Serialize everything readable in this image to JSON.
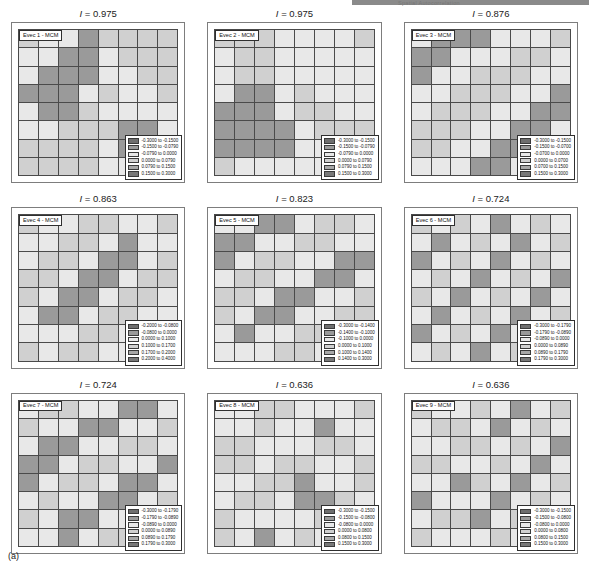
{
  "figure": {
    "label": "(a)",
    "header_note": "Spatial Autocorrelation",
    "title_prefix": "I = ",
    "palette": [
      "#6e6e6e",
      "#9a9a9a",
      "#e8e8e8",
      "#d0d0d0",
      "#a8a8a8",
      "#787878"
    ]
  },
  "chart_data": {
    "type": "heatmap",
    "xlabel": "",
    "ylabel": "",
    "grid_rows": 8,
    "grid_cols": 8,
    "legend_position": "inside-bottom-right",
    "panels": [
      {
        "panel_index": 1,
        "tag": "Evec 1 - MCM",
        "moran_i": "0.975",
        "title": "I = 0.975",
        "legend": [
          "-0.3000 to -0.1500",
          "-0.1500 to -0.0790",
          "-0.0790 to 0.0000",
          "0.0000 to 0.0790",
          "0.0790 to 0.1500",
          "0.1500 to 0.3000"
        ],
        "classes": [
          [
            3,
            2,
            2,
            1,
            3,
            3,
            3,
            3
          ],
          [
            2,
            2,
            1,
            1,
            2,
            3,
            3,
            3
          ],
          [
            2,
            1,
            1,
            1,
            2,
            2,
            3,
            3
          ],
          [
            1,
            1,
            1,
            2,
            3,
            2,
            2,
            3
          ],
          [
            2,
            1,
            1,
            3,
            2,
            2,
            2,
            2
          ],
          [
            2,
            2,
            3,
            3,
            3,
            1,
            1,
            2
          ],
          [
            3,
            3,
            3,
            3,
            2,
            1,
            1,
            2
          ],
          [
            3,
            3,
            3,
            3,
            2,
            2,
            2,
            3
          ]
        ]
      },
      {
        "panel_index": 2,
        "tag": "Evec 2 - MCM",
        "moran_i": "0.975",
        "title": "I = 0.975",
        "legend": [
          "-0.3000 to -0.1500",
          "-0.1500 to -0.0790",
          "-0.0790 to 0.0000",
          "0.0000 to 0.0790",
          "0.0790 to 0.1500",
          "0.1500 to 0.3000"
        ],
        "classes": [
          [
            3,
            3,
            3,
            2,
            2,
            2,
            2,
            3
          ],
          [
            2,
            3,
            3,
            2,
            2,
            2,
            2,
            2
          ],
          [
            2,
            3,
            3,
            2,
            2,
            2,
            2,
            2
          ],
          [
            2,
            1,
            1,
            2,
            3,
            2,
            2,
            2
          ],
          [
            1,
            1,
            1,
            2,
            3,
            3,
            2,
            2
          ],
          [
            1,
            1,
            1,
            1,
            2,
            3,
            3,
            3
          ],
          [
            1,
            1,
            1,
            1,
            2,
            2,
            3,
            3
          ],
          [
            3,
            2,
            2,
            2,
            2,
            2,
            3,
            3
          ]
        ]
      },
      {
        "panel_index": 3,
        "tag": "Evec 3 - MCM",
        "moran_i": "0.876",
        "title": "I = 0.876",
        "legend": [
          "-0.3000 to -0.1500",
          "-0.1500 to -0.0700",
          "-0.0700 to 0.0000",
          "0.0000 to 0.0700",
          "0.0700 to 0.1500",
          "0.1500 to 0.3000"
        ],
        "classes": [
          [
            2,
            1,
            1,
            1,
            2,
            2,
            2,
            3
          ],
          [
            1,
            1,
            2,
            2,
            2,
            3,
            3,
            2
          ],
          [
            1,
            2,
            2,
            3,
            3,
            3,
            2,
            2
          ],
          [
            2,
            2,
            3,
            3,
            3,
            2,
            2,
            1
          ],
          [
            2,
            3,
            3,
            3,
            2,
            2,
            1,
            1
          ],
          [
            3,
            3,
            3,
            2,
            2,
            1,
            1,
            2
          ],
          [
            3,
            3,
            2,
            2,
            1,
            1,
            2,
            2
          ],
          [
            2,
            2,
            2,
            1,
            1,
            2,
            2,
            3
          ]
        ]
      },
      {
        "panel_index": 4,
        "tag": "Evec 4 - MCM",
        "moran_i": "0.863",
        "title": "I = 0.863",
        "legend": [
          "-0.2000 to -0.0800",
          "-0.0800 to 0.0000",
          "0.0000 to 0.1000",
          "0.1000 to 0.1700",
          "0.1700 to 0.2000",
          "0.2000 to 0.4000"
        ],
        "classes": [
          [
            3,
            2,
            2,
            3,
            3,
            2,
            2,
            3
          ],
          [
            2,
            2,
            3,
            3,
            2,
            1,
            2,
            2
          ],
          [
            2,
            3,
            3,
            2,
            1,
            1,
            2,
            3
          ],
          [
            3,
            3,
            2,
            1,
            1,
            2,
            3,
            3
          ],
          [
            3,
            2,
            1,
            1,
            2,
            3,
            3,
            2
          ],
          [
            2,
            1,
            1,
            2,
            3,
            3,
            2,
            2
          ],
          [
            2,
            2,
            2,
            3,
            3,
            2,
            2,
            3
          ],
          [
            3,
            2,
            3,
            3,
            2,
            2,
            3,
            3
          ]
        ]
      },
      {
        "panel_index": 5,
        "tag": "Evec 5 - MCM",
        "moran_i": "0.823",
        "title": "I = 0.823",
        "legend": [
          "-0.3000 to -0.1400",
          "-0.1400 to -0.1000",
          "-0.1000 to 0.0000",
          "0.0000 to 0.1000",
          "0.1000 to 0.1400",
          "0.1400 to 0.3000"
        ],
        "classes": [
          [
            2,
            2,
            1,
            1,
            2,
            3,
            3,
            2
          ],
          [
            1,
            1,
            2,
            2,
            3,
            3,
            2,
            2
          ],
          [
            1,
            2,
            3,
            3,
            2,
            2,
            1,
            1
          ],
          [
            2,
            3,
            3,
            2,
            2,
            1,
            1,
            2
          ],
          [
            3,
            3,
            2,
            1,
            1,
            2,
            2,
            3
          ],
          [
            3,
            2,
            1,
            1,
            2,
            2,
            3,
            3
          ],
          [
            2,
            1,
            2,
            2,
            3,
            3,
            2,
            2
          ],
          [
            2,
            2,
            2,
            3,
            3,
            2,
            1,
            1
          ]
        ]
      },
      {
        "panel_index": 6,
        "tag": "Evec 6 - MCM",
        "moran_i": "0.724",
        "title": "I = 0.724",
        "legend": [
          "-0.3000 to -0.1790",
          "-0.1790 to -0.0890",
          "-0.0890 to 0.0000",
          "0.0000 to 0.0890",
          "0.0890 to 0.1790",
          "0.1790 to 0.3000"
        ],
        "classes": [
          [
            3,
            2,
            3,
            2,
            1,
            2,
            3,
            2
          ],
          [
            2,
            1,
            2,
            3,
            2,
            1,
            2,
            3
          ],
          [
            1,
            2,
            3,
            2,
            1,
            2,
            3,
            2
          ],
          [
            2,
            3,
            2,
            1,
            2,
            3,
            2,
            1
          ],
          [
            3,
            2,
            1,
            2,
            3,
            2,
            1,
            2
          ],
          [
            2,
            1,
            2,
            3,
            2,
            1,
            2,
            3
          ],
          [
            1,
            2,
            3,
            2,
            1,
            2,
            3,
            2
          ],
          [
            2,
            3,
            2,
            1,
            2,
            3,
            2,
            1
          ]
        ]
      },
      {
        "panel_index": 7,
        "tag": "Evec 7 - MCM",
        "moran_i": "0.724",
        "title": "I = 0.724",
        "legend": [
          "-0.3000 to -0.1790",
          "-0.1790 to -0.0890",
          "-0.0890 to 0.0000",
          "0.0000 to 0.0890",
          "0.0890 to 0.1790",
          "0.1790 to 0.3000"
        ],
        "classes": [
          [
            2,
            3,
            3,
            2,
            2,
            1,
            1,
            2
          ],
          [
            3,
            2,
            2,
            1,
            1,
            2,
            2,
            3
          ],
          [
            2,
            1,
            1,
            2,
            2,
            3,
            3,
            2
          ],
          [
            1,
            1,
            2,
            3,
            3,
            2,
            2,
            1
          ],
          [
            1,
            2,
            3,
            3,
            2,
            1,
            1,
            2
          ],
          [
            2,
            3,
            2,
            2,
            1,
            1,
            2,
            3
          ],
          [
            3,
            2,
            1,
            1,
            2,
            2,
            3,
            3
          ],
          [
            2,
            2,
            1,
            2,
            3,
            3,
            2,
            2
          ]
        ]
      },
      {
        "panel_index": 8,
        "tag": "Evec 8 - MCM",
        "moran_i": "0.636",
        "title": "I = 0.636",
        "legend": [
          "-0.3000 to -0.1500",
          "-0.1500 to -0.0800",
          "-0.0800 to 0.0000",
          "0.0000 to 0.0800",
          "0.0800 to 0.1500",
          "0.1500 to 0.3000"
        ],
        "classes": [
          [
            2,
            2,
            3,
            3,
            2,
            2,
            2,
            3
          ],
          [
            2,
            2,
            3,
            2,
            2,
            1,
            2,
            2
          ],
          [
            3,
            3,
            2,
            2,
            2,
            3,
            3,
            2
          ],
          [
            3,
            3,
            2,
            3,
            3,
            2,
            2,
            3
          ],
          [
            2,
            2,
            3,
            3,
            1,
            2,
            2,
            3
          ],
          [
            2,
            3,
            3,
            2,
            1,
            1,
            3,
            2
          ],
          [
            3,
            2,
            2,
            2,
            2,
            3,
            3,
            2
          ],
          [
            3,
            2,
            1,
            2,
            3,
            2,
            2,
            3
          ]
        ]
      },
      {
        "panel_index": 9,
        "tag": "Evec 9 - MCM",
        "moran_i": "0.636",
        "title": "I = 0.636",
        "legend": [
          "-0.3000 to -0.1500",
          "-0.1500 to -0.0800",
          "-0.0800 to 0.0000",
          "0.0000 to 0.0800",
          "0.0800 to 0.1500",
          "0.1500 to 0.3000"
        ],
        "classes": [
          [
            3,
            2,
            2,
            3,
            2,
            1,
            2,
            3
          ],
          [
            2,
            3,
            3,
            2,
            1,
            2,
            3,
            2
          ],
          [
            2,
            2,
            3,
            3,
            2,
            3,
            2,
            1
          ],
          [
            3,
            3,
            2,
            2,
            3,
            2,
            1,
            2
          ],
          [
            2,
            2,
            1,
            3,
            2,
            1,
            2,
            3
          ],
          [
            1,
            2,
            2,
            2,
            1,
            2,
            3,
            2
          ],
          [
            2,
            3,
            3,
            1,
            2,
            3,
            2,
            2
          ],
          [
            3,
            2,
            2,
            2,
            3,
            2,
            2,
            3
          ]
        ]
      }
    ]
  }
}
